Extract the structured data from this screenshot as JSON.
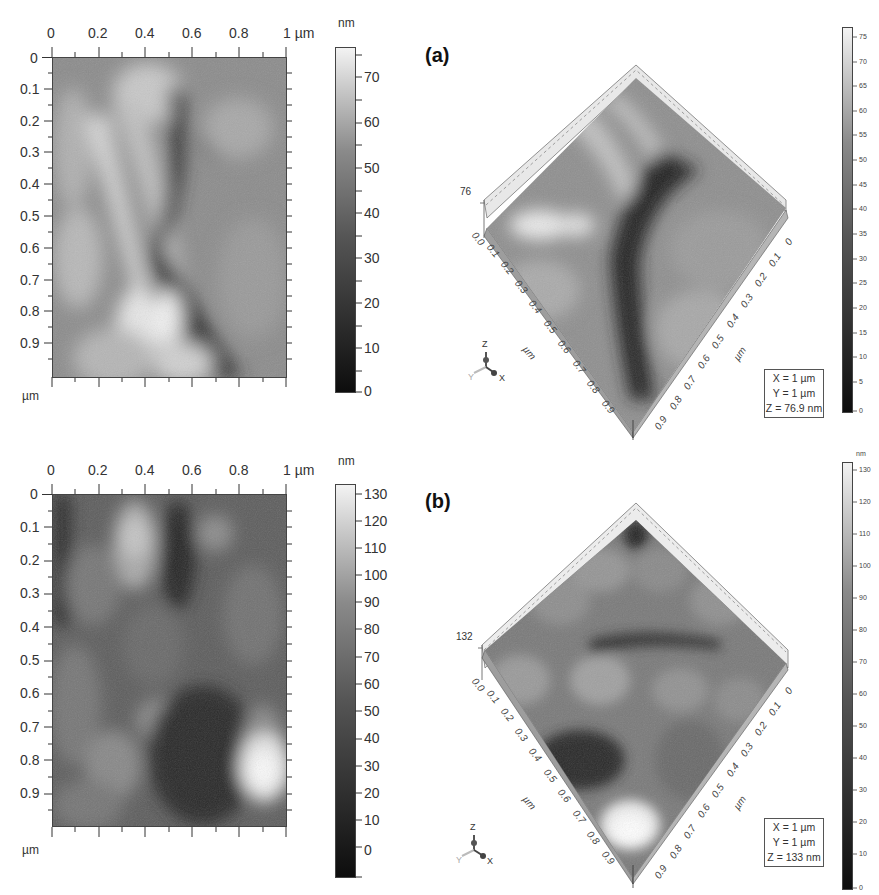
{
  "figure": {
    "panels": [
      {
        "id": "a",
        "label": "(a)",
        "map2d": {
          "x_ticks": [
            "0",
            "0.2",
            "0.4",
            "0.6",
            "0.8",
            "1 µm"
          ],
          "y_ticks": [
            "0",
            "0.1",
            "0.2",
            "0.3",
            "0.4",
            "0.5",
            "0.6",
            "0.7",
            "0.8",
            "0.9"
          ],
          "y_unit": "µm",
          "colorbar_unit": "nm",
          "colorbar_ticks": [
            "70",
            "60",
            "50",
            "40",
            "30",
            "20",
            "10",
            "0"
          ]
        },
        "view3d": {
          "z_max_label": "76",
          "origin_label": "0.0",
          "left_axis_ticks": [
            "0.1",
            "0.2",
            "0.3",
            "0.4",
            "0.5",
            "0.6",
            "0.7",
            "0.8",
            "0.9"
          ],
          "right_axis_ticks": [
            "0",
            "0.1",
            "0.2",
            "0.3",
            "0.4",
            "0.5",
            "0.6",
            "0.7",
            "0.8",
            "0.9"
          ],
          "axis_unit": "µm",
          "orientation": {
            "z": "Z",
            "y": "Y",
            "x": "X"
          },
          "dims": {
            "x": "X = 1 µm",
            "y": "Y = 1 µm",
            "z": "Z = 76.9 nm"
          },
          "colorbar_ticks": [
            "75",
            "70",
            "65",
            "60",
            "55",
            "50",
            "45",
            "40",
            "35",
            "30",
            "25",
            "20",
            "15",
            "10",
            "5",
            "0"
          ]
        }
      },
      {
        "id": "b",
        "label": "(b)",
        "map2d": {
          "x_ticks": [
            "0",
            "0.2",
            "0.4",
            "0.6",
            "0.8",
            "1 µm"
          ],
          "y_ticks": [
            "0",
            "0.1",
            "0.2",
            "0.3",
            "0.4",
            "0.5",
            "0.6",
            "0.7",
            "0.8",
            "0.9"
          ],
          "y_unit": "µm",
          "colorbar_unit": "nm",
          "colorbar_ticks": [
            "130",
            "120",
            "110",
            "100",
            "90",
            "80",
            "70",
            "60",
            "50",
            "40",
            "30",
            "20",
            "10",
            "0"
          ]
        },
        "view3d": {
          "z_max_label": "132",
          "origin_label": "0.0",
          "left_axis_ticks": [
            "0.1",
            "0.2",
            "0.3",
            "0.4",
            "0.5",
            "0.6",
            "0.7",
            "0.8",
            "0.9"
          ],
          "right_axis_ticks": [
            "0",
            "0.1",
            "0.2",
            "0.3",
            "0.4",
            "0.5",
            "0.6",
            "0.7",
            "0.8",
            "0.9"
          ],
          "axis_unit": "µm",
          "orientation": {
            "z": "Z",
            "y": "Y",
            "x": "X"
          },
          "dims": {
            "x": "X = 1 µm",
            "y": "Y = 1 µm",
            "z": "Z = 133 nm"
          },
          "colorbar_unit": "nm",
          "colorbar_ticks": [
            "130",
            "120",
            "110",
            "100",
            "90",
            "80",
            "70",
            "60",
            "50",
            "40",
            "30",
            "20",
            "10",
            "0"
          ]
        }
      }
    ]
  }
}
